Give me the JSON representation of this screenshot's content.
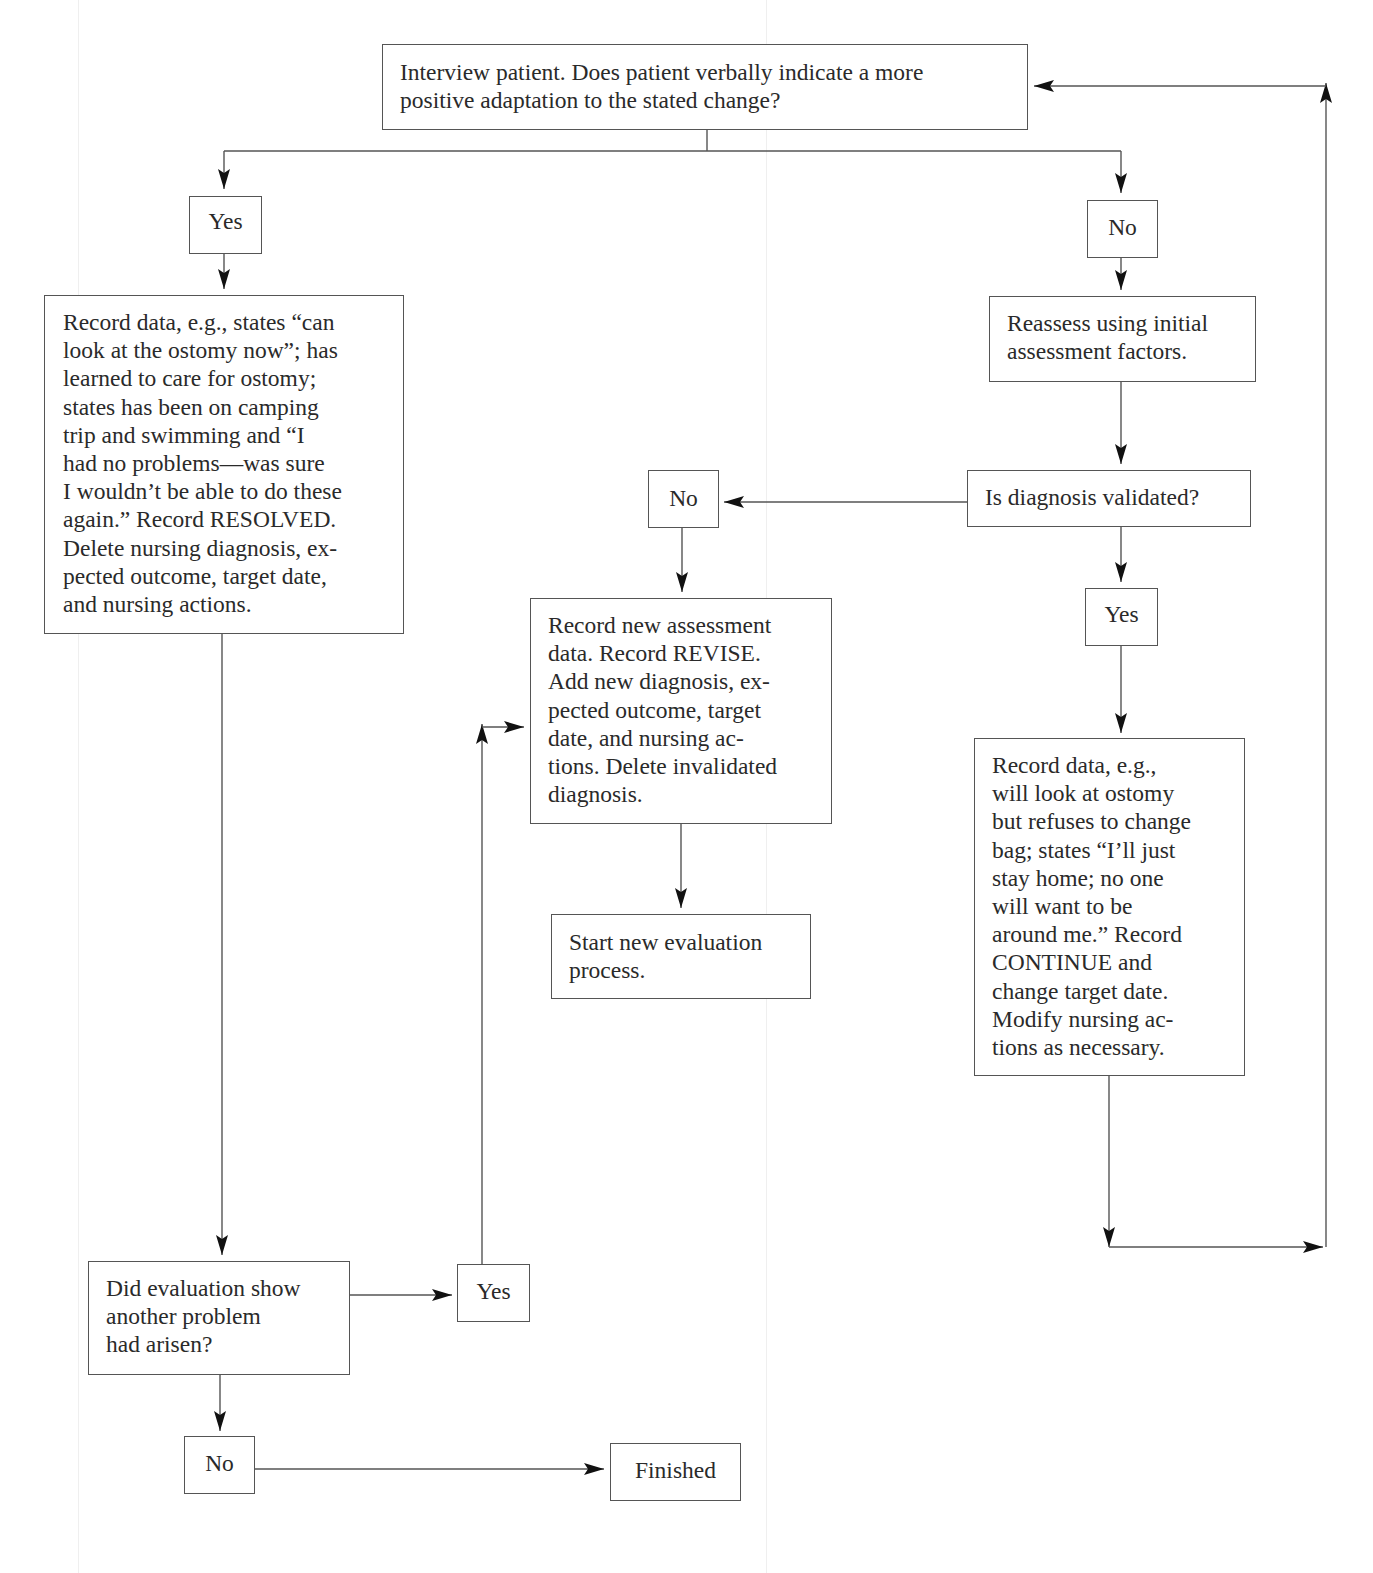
{
  "diagram": {
    "type": "flowchart",
    "colors": {
      "line": "#555555",
      "arrow": "#111111",
      "text": "#2a2a2a",
      "background": "#ffffff"
    },
    "nodes": {
      "interview": {
        "text": "Interview patient. Does patient verbally indicate a more\npositive adaptation to the stated change?"
      },
      "yes_top": {
        "text": "Yes"
      },
      "no_top": {
        "text": "No"
      },
      "record_resolved": {
        "text": "Record data, e.g., states “can\nlook at the ostomy now”; has\nlearned to care for ostomy;\nstates has been on camping\ntrip and swimming and “I\nhad no problems—was sure\nI wouldn’t be able to do these\nagain.”  Record RESOLVED.\nDelete nursing diagnosis, ex-\npected outcome, target date,\nand nursing actions."
      },
      "reassess": {
        "text": "Reassess using initial\nassessment factors."
      },
      "diagnosis_validated": {
        "text": "Is diagnosis validated?"
      },
      "no_mid": {
        "text": "No"
      },
      "yes_right": {
        "text": "Yes"
      },
      "record_revise": {
        "text": "Record new assessment\ndata. Record REVISE.\nAdd new diagnosis, ex-\npected outcome, target\ndate, and nursing ac-\ntions. Delete invalidated\ndiagnosis."
      },
      "start_new": {
        "text": "Start new evaluation\nprocess."
      },
      "record_continue": {
        "text": "Record data, e.g.,\nwill look at ostomy\nbut refuses to change\nbag; states “I’ll just\nstay home; no one\nwill want to be\naround me.”  Record\nCONTINUE and\nchange target date.\nModify nursing ac-\ntions as necessary."
      },
      "another_problem": {
        "text": "Did evaluation show\nanother problem\nhad arisen?"
      },
      "yes_bottom": {
        "text": "Yes"
      },
      "no_bottom": {
        "text": "No"
      },
      "finished": {
        "text": "Finished"
      }
    },
    "edges": [
      {
        "from": "interview",
        "to": "yes_top"
      },
      {
        "from": "interview",
        "to": "no_top"
      },
      {
        "from": "yes_top",
        "to": "record_resolved"
      },
      {
        "from": "no_top",
        "to": "reassess"
      },
      {
        "from": "reassess",
        "to": "diagnosis_validated"
      },
      {
        "from": "diagnosis_validated",
        "to": "no_mid"
      },
      {
        "from": "diagnosis_validated",
        "to": "yes_right"
      },
      {
        "from": "no_mid",
        "to": "record_revise"
      },
      {
        "from": "yes_right",
        "to": "record_continue"
      },
      {
        "from": "record_revise",
        "to": "start_new"
      },
      {
        "from": "record_continue",
        "to": "interview",
        "note": "loop back"
      },
      {
        "from": "record_resolved",
        "to": "another_problem"
      },
      {
        "from": "another_problem",
        "to": "yes_bottom"
      },
      {
        "from": "another_problem",
        "to": "no_bottom"
      },
      {
        "from": "yes_bottom",
        "to": "record_revise"
      },
      {
        "from": "no_bottom",
        "to": "finished"
      }
    ]
  }
}
